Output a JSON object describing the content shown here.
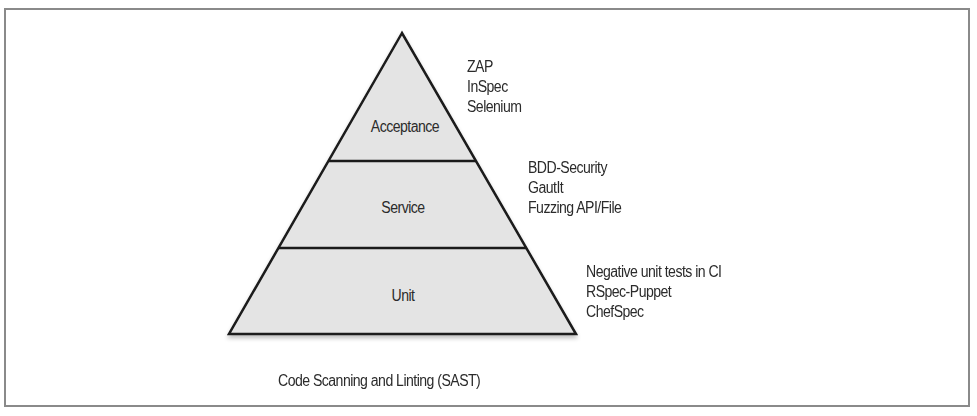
{
  "diagram": {
    "type": "pyramid",
    "layers": [
      {
        "label": "Acceptance",
        "tools": [
          "ZAP",
          "InSpec",
          "Selenium"
        ]
      },
      {
        "label": "Service",
        "tools": [
          "BDD-Security",
          "GautIt",
          "Fuzzing API/File"
        ]
      },
      {
        "label": "Unit",
        "tools": [
          "Negative unit tests in CI",
          "RSpec-Puppet",
          "ChefSpec"
        ]
      }
    ],
    "foundation": "Code Scanning and Linting (SAST)",
    "colors": {
      "fill": "#e4e4e4",
      "stroke": "#1a1a1a",
      "frame": "#8a8a8a",
      "text": "#2b2b2b"
    }
  }
}
